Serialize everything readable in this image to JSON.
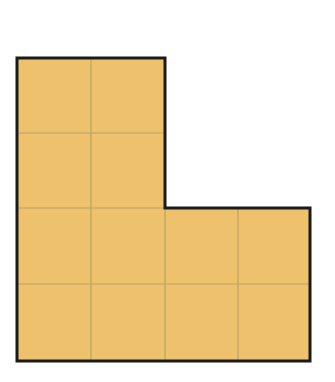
{
  "figure": {
    "shape": "L",
    "grid": {
      "columns": 4,
      "rows": 4,
      "unit_squares_filled": 12
    },
    "rows_filled": [
      [
        1,
        1,
        0,
        0
      ],
      [
        1,
        1,
        0,
        0
      ],
      [
        1,
        1,
        1,
        1
      ],
      [
        1,
        1,
        1,
        1
      ]
    ],
    "colors": {
      "fill": "#eec26d",
      "grid_line": "#b9a266",
      "outline": "#1a1a1a",
      "background": "#ffffff"
    }
  }
}
